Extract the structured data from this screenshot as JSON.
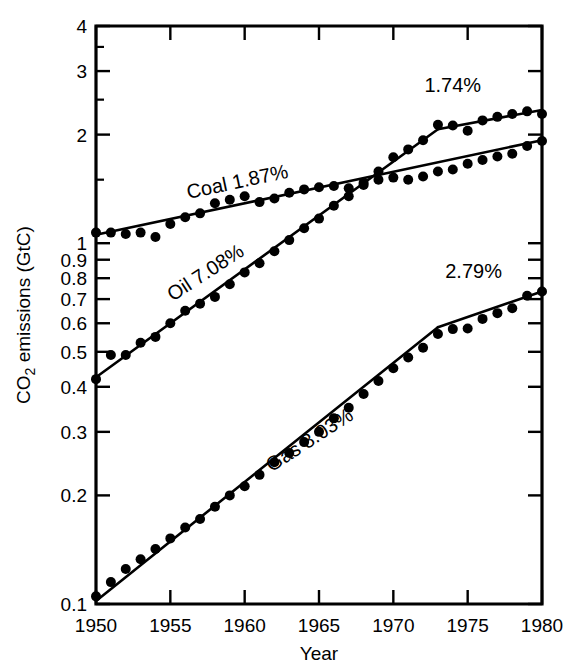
{
  "chart_data": {
    "type": "line",
    "title": "",
    "xlabel": "Year",
    "ylabel": "CO2 emissions (GtC)",
    "ylabel_display": "CO₂ emissions (GtC)",
    "yscale": "log",
    "xscale": "linear",
    "xlim": [
      1950,
      1980
    ],
    "ylim": [
      0.1,
      4
    ],
    "grid": false,
    "legend": "none (inline curve annotations)",
    "x_ticks": [
      1950,
      1955,
      1960,
      1965,
      1970,
      1975,
      1980
    ],
    "x_tick_labels": [
      "1950",
      "1955",
      "1960",
      "1965",
      "1970",
      "1975",
      "1980"
    ],
    "x_minor_ticks": [
      1951,
      1952,
      1953,
      1954,
      1956,
      1957,
      1958,
      1959,
      1961,
      1962,
      1963,
      1964,
      1966,
      1967,
      1968,
      1969,
      1971,
      1972,
      1973,
      1974,
      1976,
      1977,
      1978,
      1979
    ],
    "y_ticks": [
      0.1,
      0.2,
      0.3,
      0.4,
      0.5,
      0.6,
      0.7,
      0.8,
      0.9,
      1,
      2,
      3,
      4
    ],
    "y_tick_labels": [
      "0.1",
      "0.2",
      "0.3",
      "0.4",
      "0.5",
      "0.6",
      "0.7",
      "0.8",
      "0.9",
      "1",
      "2",
      "3",
      "4"
    ],
    "annotations": [
      {
        "id": "coal-rate",
        "text": "Coal 1.87%",
        "x": 1959.6,
        "y": 1.42,
        "rotation": -12
      },
      {
        "id": "oil-rate-early",
        "text": "Oil 7.08%",
        "x": 1957.6,
        "y": 0.8,
        "rotation": -33
      },
      {
        "id": "oil-rate-late",
        "text": "1.74%",
        "x": 1974.0,
        "y": 2.62,
        "rotation": 0
      },
      {
        "id": "gas-rate-early",
        "text": "Gas 8.03%",
        "x": 1964.6,
        "y": 0.275,
        "rotation": -33
      },
      {
        "id": "gas-rate-late",
        "text": "2.79%",
        "x": 1975.4,
        "y": 0.8,
        "rotation": 0
      }
    ],
    "series": [
      {
        "name": "Coal",
        "growth_rate_label": "1.87%",
        "x": [
          1950,
          1951,
          1952,
          1953,
          1954,
          1955,
          1956,
          1957,
          1958,
          1959,
          1960,
          1961,
          1962,
          1963,
          1964,
          1965,
          1966,
          1967,
          1968,
          1969,
          1970,
          1971,
          1972,
          1973,
          1974,
          1975,
          1976,
          1977,
          1978,
          1979,
          1980
        ],
        "values": [
          1.07,
          1.07,
          1.06,
          1.07,
          1.04,
          1.13,
          1.18,
          1.21,
          1.29,
          1.32,
          1.35,
          1.3,
          1.33,
          1.38,
          1.41,
          1.43,
          1.44,
          1.42,
          1.45,
          1.5,
          1.52,
          1.5,
          1.53,
          1.58,
          1.6,
          1.66,
          1.7,
          1.74,
          1.77,
          1.86,
          1.92
        ],
        "trend_segments": [
          {
            "x_start": 1950,
            "y_start": 1.055,
            "x_end": 1980,
            "y_end": 1.93,
            "rate_percent": 1.87
          }
        ]
      },
      {
        "name": "Oil",
        "growth_rate_label": "7.08%",
        "growth_rate_label_late": "1.74%",
        "x": [
          1950,
          1951,
          1952,
          1953,
          1954,
          1955,
          1956,
          1957,
          1958,
          1959,
          1960,
          1961,
          1962,
          1963,
          1964,
          1965,
          1966,
          1967,
          1968,
          1969,
          1970,
          1971,
          1972,
          1973,
          1974,
          1975,
          1976,
          1977,
          1978,
          1979,
          1980
        ],
        "values": [
          0.42,
          0.49,
          0.49,
          0.53,
          0.55,
          0.6,
          0.65,
          0.68,
          0.71,
          0.77,
          0.83,
          0.88,
          0.95,
          1.02,
          1.1,
          1.17,
          1.27,
          1.35,
          1.47,
          1.58,
          1.73,
          1.82,
          1.93,
          2.13,
          2.12,
          2.05,
          2.19,
          2.24,
          2.28,
          2.32,
          2.28
        ],
        "trend_segments": [
          {
            "x_start": 1950,
            "y_start": 0.425,
            "x_end": 1973,
            "y_end": 2.07,
            "rate_percent": 7.08
          },
          {
            "x_start": 1973,
            "y_start": 2.07,
            "x_end": 1980,
            "y_end": 2.34,
            "rate_percent": 1.74
          }
        ]
      },
      {
        "name": "Gas",
        "growth_rate_label": "8.03%",
        "growth_rate_label_late": "2.79%",
        "x": [
          1950,
          1951,
          1952,
          1953,
          1954,
          1955,
          1956,
          1957,
          1958,
          1959,
          1960,
          1961,
          1962,
          1963,
          1964,
          1965,
          1966,
          1967,
          1968,
          1969,
          1970,
          1971,
          1972,
          1973,
          1974,
          1975,
          1976,
          1977,
          1978,
          1979,
          1980
        ],
        "values": [
          0.105,
          0.115,
          0.125,
          0.133,
          0.142,
          0.152,
          0.163,
          0.172,
          0.186,
          0.2,
          0.212,
          0.228,
          0.247,
          0.262,
          0.281,
          0.3,
          0.327,
          0.35,
          0.382,
          0.415,
          0.45,
          0.482,
          0.513,
          0.56,
          0.578,
          0.58,
          0.617,
          0.64,
          0.66,
          0.715,
          0.735
        ],
        "trend_segments": [
          {
            "x_start": 1950,
            "y_start": 0.102,
            "x_end": 1973,
            "y_end": 0.585,
            "rate_percent": 8.03
          },
          {
            "x_start": 1973,
            "y_start": 0.585,
            "x_end": 1980,
            "y_end": 0.735,
            "rate_percent": 2.79
          }
        ]
      }
    ]
  },
  "figure": {
    "background_color": "#ffffff",
    "ink_color": "#000000",
    "marker": "filled-circle",
    "marker_radius_px": 5
  }
}
